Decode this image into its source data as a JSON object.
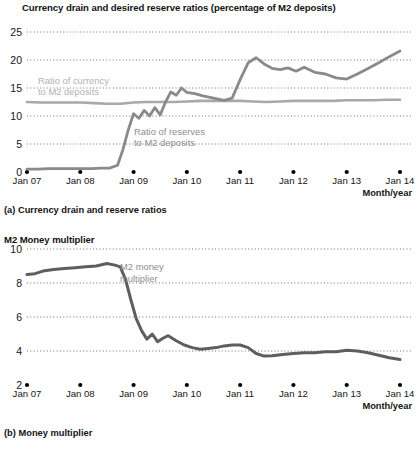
{
  "figure": {
    "panels": [
      {
        "id": "a",
        "title": "Currency drain and desired reserve ratios (percentage of M2 deposits)",
        "caption": "(a) Currency drain and reserve ratios"
      },
      {
        "id": "b",
        "title": "M2 Money multiplier",
        "caption": "(b) Money multiplier"
      }
    ],
    "axis_title": "Month/year",
    "colors": {
      "currency_line": "#a9a9a9",
      "reserves_line": "#8a8a8a",
      "multiplier_line": "#5e5e5e",
      "gridline": "#6f6f6f",
      "text": "#141414",
      "annotation_light": "#b2b2b2",
      "annotation_dark": "#8e8e8e"
    }
  },
  "chart_data": [
    {
      "type": "line",
      "title": "Currency drain and desired reserve ratios (percentage of M2 deposits)",
      "subtitle": "(a) Currency drain and reserve ratios",
      "xlabel": "Month/year",
      "ylabel": "",
      "ylim": [
        0,
        25
      ],
      "yticks": [
        0,
        5,
        10,
        15,
        20,
        25
      ],
      "xticks": [
        "Jan 07",
        "Jan 08",
        "Jan 09",
        "Jan 10",
        "Jan 11",
        "Jan 12",
        "Jan 13",
        "Jan 14"
      ],
      "xlim": [
        2007.0,
        2014.0
      ],
      "grid": true,
      "legend_position": "inline-annotation",
      "series": [
        {
          "name": "Ratio of currency to M2 deposits",
          "annotation": "Ratio of currency\nto M2 deposits",
          "color": "#a9a9a9",
          "x": [
            2007.0,
            2007.25,
            2007.5,
            2007.75,
            2008.0,
            2008.25,
            2008.5,
            2008.75,
            2009.0,
            2009.25,
            2009.5,
            2009.75,
            2010.0,
            2010.25,
            2010.5,
            2010.75,
            2011.0,
            2011.25,
            2011.5,
            2011.75,
            2012.0,
            2012.25,
            2012.5,
            2012.75,
            2013.0,
            2013.25,
            2013.5,
            2013.75,
            2014.0
          ],
          "values": [
            12.5,
            12.4,
            12.4,
            12.4,
            12.4,
            12.3,
            12.2,
            12.2,
            12.4,
            12.5,
            12.5,
            12.5,
            12.6,
            12.7,
            12.7,
            12.7,
            12.7,
            12.6,
            12.5,
            12.6,
            12.7,
            12.7,
            12.7,
            12.7,
            12.8,
            12.8,
            12.8,
            12.9,
            12.9
          ]
        },
        {
          "name": "Ratio of reserves to M2 deposits",
          "annotation": "Ratio of reserves\nto M2 deposits",
          "color": "#8a8a8a",
          "x": [
            2007.0,
            2007.2,
            2007.4,
            2007.6,
            2007.8,
            2008.0,
            2008.2,
            2008.4,
            2008.55,
            2008.7,
            2008.8,
            2008.9,
            2009.0,
            2009.1,
            2009.2,
            2009.3,
            2009.4,
            2009.5,
            2009.6,
            2009.7,
            2009.8,
            2009.9,
            2010.0,
            2010.15,
            2010.3,
            2010.5,
            2010.7,
            2010.85,
            2011.0,
            2011.15,
            2011.3,
            2011.45,
            2011.6,
            2011.75,
            2011.9,
            2012.05,
            2012.2,
            2012.4,
            2012.6,
            2012.8,
            2013.0,
            2013.2,
            2013.4,
            2013.6,
            2013.8,
            2014.0
          ],
          "values": [
            0.5,
            0.5,
            0.6,
            0.6,
            0.6,
            0.6,
            0.6,
            0.7,
            0.7,
            1.2,
            4.0,
            7.5,
            10.4,
            9.6,
            11.0,
            10.0,
            11.5,
            10.2,
            12.5,
            14.3,
            13.7,
            15.0,
            14.2,
            14.0,
            13.6,
            13.2,
            12.8,
            13.2,
            16.5,
            19.5,
            20.4,
            19.3,
            18.5,
            18.3,
            18.6,
            18.0,
            18.7,
            17.8,
            17.5,
            16.8,
            16.6,
            17.5,
            18.5,
            19.5,
            20.6,
            21.6
          ]
        }
      ]
    },
    {
      "type": "line",
      "title": "M2 Money multiplier",
      "subtitle": "(b) Money multiplier",
      "xlabel": "Month/year",
      "ylabel": "",
      "ylim": [
        2,
        10
      ],
      "yticks": [
        2,
        4,
        6,
        8,
        10
      ],
      "xticks": [
        "Jan 07",
        "Jan 08",
        "Jan 09",
        "Jan 10",
        "Jan 11",
        "Jan 12",
        "Jan 13",
        "Jan 14"
      ],
      "xlim": [
        2007.0,
        2014.0
      ],
      "grid": true,
      "legend_position": "inline-annotation",
      "series": [
        {
          "name": "M2 money multiplier",
          "annotation": "M2 money\nmultiplier",
          "color": "#5e5e5e",
          "x": [
            2007.0,
            2007.15,
            2007.3,
            2007.5,
            2007.7,
            2007.9,
            2008.1,
            2008.3,
            2008.5,
            2008.65,
            2008.75,
            2008.85,
            2008.95,
            2009.05,
            2009.15,
            2009.25,
            2009.35,
            2009.45,
            2009.55,
            2009.65,
            2009.8,
            2009.95,
            2010.1,
            2010.25,
            2010.4,
            2010.55,
            2010.7,
            2010.85,
            2011.0,
            2011.15,
            2011.3,
            2011.45,
            2011.6,
            2011.8,
            2012.0,
            2012.2,
            2012.4,
            2012.6,
            2012.8,
            2013.0,
            2013.2,
            2013.4,
            2013.6,
            2013.8,
            2014.0
          ],
          "values": [
            8.5,
            8.55,
            8.7,
            8.8,
            8.85,
            8.9,
            8.95,
            9.0,
            9.15,
            9.05,
            8.95,
            8.2,
            7.0,
            5.9,
            5.2,
            4.7,
            5.0,
            4.55,
            4.75,
            4.9,
            4.6,
            4.35,
            4.2,
            4.1,
            4.15,
            4.2,
            4.3,
            4.35,
            4.35,
            4.2,
            3.85,
            3.7,
            3.72,
            3.8,
            3.85,
            3.9,
            3.9,
            3.95,
            3.95,
            4.05,
            4.0,
            3.9,
            3.75,
            3.6,
            3.5
          ]
        }
      ]
    }
  ]
}
